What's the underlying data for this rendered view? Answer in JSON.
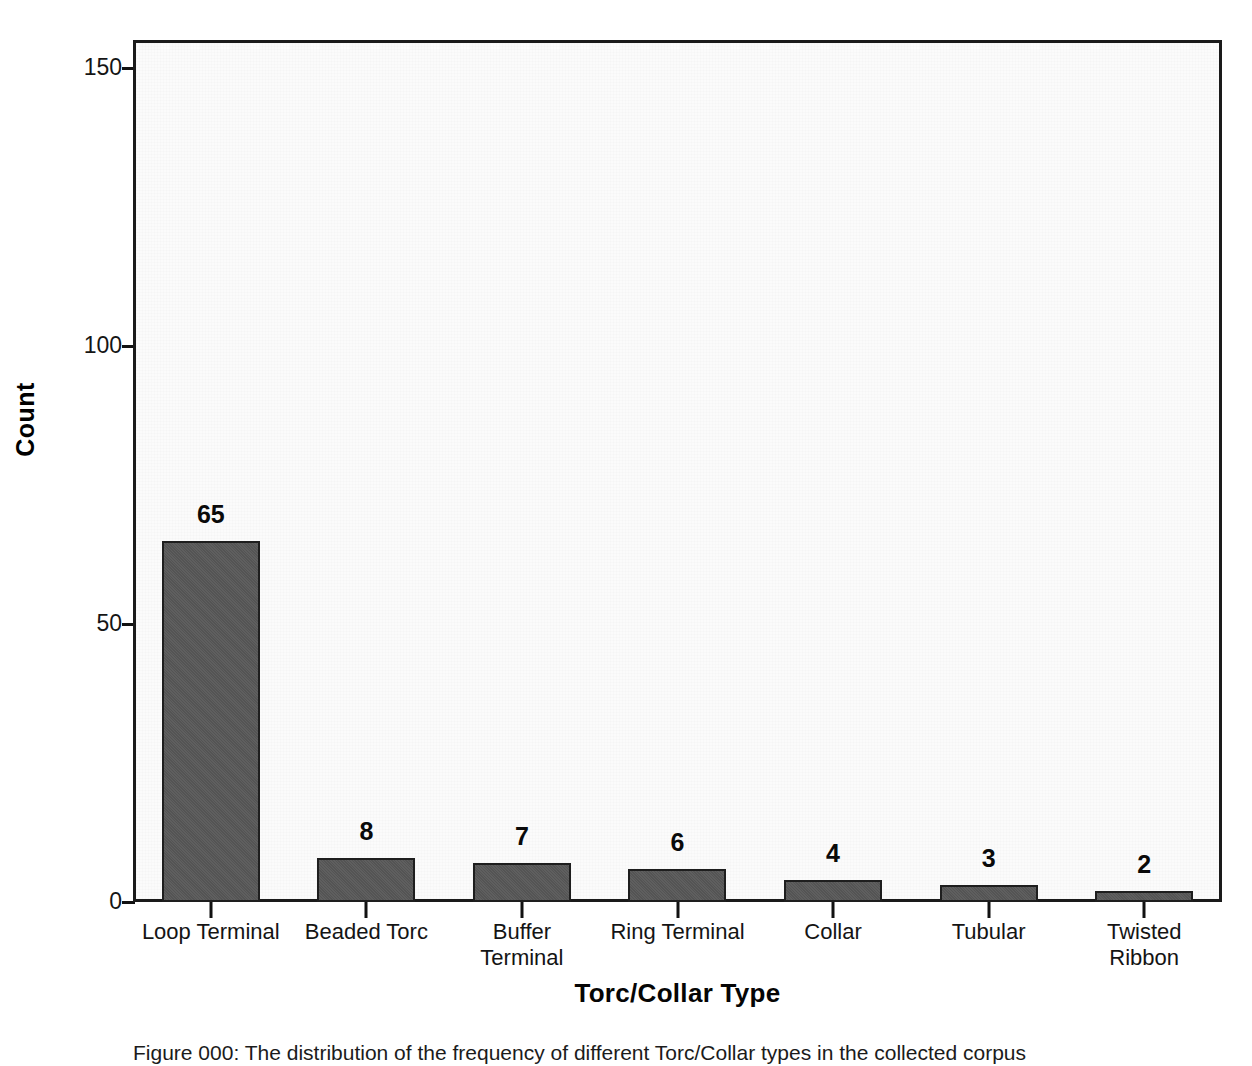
{
  "chart_data": {
    "type": "bar",
    "title": "",
    "xlabel": "Torc/Collar Type",
    "ylabel": "Count",
    "categories": [
      "Loop Terminal",
      "Beaded Torc",
      "Buffer Terminal",
      "Ring Terminal",
      "Collar",
      "Tubular",
      "Twisted Ribbon"
    ],
    "category_lines": [
      [
        "Loop Terminal"
      ],
      [
        "Beaded Torc"
      ],
      [
        "Buffer",
        "Terminal"
      ],
      [
        "Ring Terminal"
      ],
      [
        "Collar"
      ],
      [
        "Tubular"
      ],
      [
        "Twisted",
        "Ribbon"
      ]
    ],
    "values": [
      65,
      8,
      7,
      6,
      4,
      3,
      2
    ],
    "value_labels": [
      "65",
      "8",
      "7",
      "6",
      "4",
      "3",
      "2"
    ],
    "ylim": [
      0,
      155
    ],
    "yticks": [
      0,
      50,
      100,
      150
    ],
    "ytick_labels": [
      "0",
      "50",
      "100",
      "150"
    ],
    "grid": false,
    "legend": "none",
    "bar_fill_color": "#585858",
    "bar_border_color": "#1e1e1e",
    "plot_background_color": "#fbfbfb",
    "axis_color": "#1a1a1a"
  },
  "figure": {
    "caption": "Figure 000: The distribution of the frequency of different Torc/Collar types in the collected corpus"
  }
}
